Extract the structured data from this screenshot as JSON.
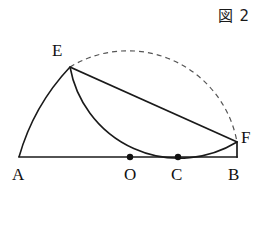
{
  "figure": {
    "caption": "図 2",
    "width": 260,
    "height": 226,
    "stroke_color": "#1a1a1a",
    "background": "#ffffff"
  },
  "points": {
    "A": {
      "label": "A",
      "x": 19,
      "y": 157,
      "label_x": 12,
      "label_y": 166,
      "dot": false
    },
    "O": {
      "label": "O",
      "x": 130,
      "y": 157,
      "label_x": 124,
      "label_y": 166,
      "dot": true
    },
    "C": {
      "label": "C",
      "x": 178,
      "y": 157,
      "label_x": 171,
      "label_y": 166,
      "dot": true
    },
    "B": {
      "label": "B",
      "x": 237,
      "y": 157,
      "label_x": 228,
      "label_y": 166,
      "dot": false
    },
    "E": {
      "label": "E",
      "x": 70,
      "y": 67,
      "label_x": 52,
      "label_y": 42,
      "dot": false
    },
    "F": {
      "label": "F",
      "x": 237,
      "y": 142,
      "label_x": 241,
      "label_y": 129,
      "dot": false
    }
  },
  "segments": [
    {
      "name": "baseline-AB",
      "from": "A",
      "to": "B",
      "style": "solid"
    },
    {
      "name": "chord-EF",
      "from": "E",
      "to": "F",
      "style": "solid"
    },
    {
      "name": "segment-FB",
      "from": "F",
      "to": "B",
      "style": "solid"
    }
  ],
  "arcs": [
    {
      "name": "arc-AE-centered-B",
      "style": "solid",
      "center_x": 237,
      "center_y": 157,
      "radius": 218,
      "start_x": 19,
      "start_y": 157,
      "end_x": 70,
      "end_y": 67,
      "large_arc": 0,
      "sweep": 1
    },
    {
      "name": "arc-EF-through-C-centered-O",
      "style": "solid",
      "center_x": 130,
      "center_y": 157,
      "radius": 111,
      "start_x": 70,
      "start_y": 67,
      "end_x": 237,
      "end_y": 142,
      "large_arc": 0,
      "sweep": 0
    },
    {
      "name": "semicircle-AB-dashed",
      "style": "dashed",
      "center_x": 130,
      "center_y": 157,
      "radius": 111,
      "start_x": 70,
      "start_y": 67,
      "end_x": 237,
      "end_y": 142,
      "large_arc": 0,
      "sweep": 1
    }
  ],
  "dot_radius": 3.2
}
